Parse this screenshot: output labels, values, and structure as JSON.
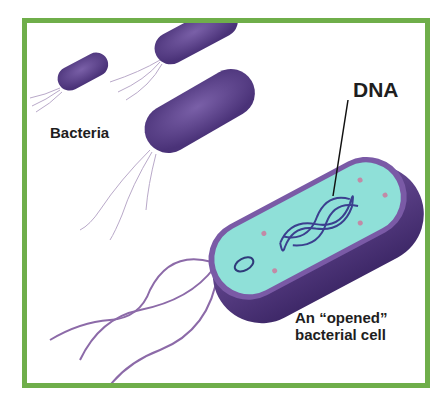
{
  "diagram": {
    "labels": {
      "bacteria": "Bacteria",
      "dna": "DNA",
      "opened_cell_line1": "An “opened”",
      "opened_cell_line2": "bacterial cell"
    },
    "colors": {
      "frame_border": "#6fae4a",
      "bacterium_body": "#5a3f86",
      "bacterium_dark": "#3f2a66",
      "cytoplasm": "#8fe0d8",
      "membrane": "#7a5aa6",
      "dna_strand": "#3b3f8f",
      "flagella": "#8c6aa8"
    },
    "elements": [
      "small bacterium (top-left)",
      "bacterium (top-center, partially cut off)",
      "large bacterium (middle)",
      "opened bacterial cell showing cytoplasm, plasmid, and DNA",
      "flagella",
      "DNA pointer line"
    ]
  }
}
